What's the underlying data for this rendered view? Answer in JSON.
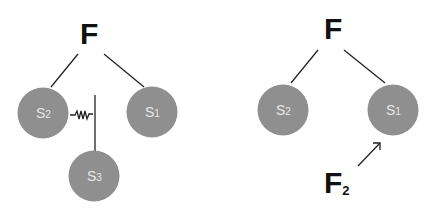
{
  "left_diagram": {
    "force_label": "F",
    "nodes": [
      {
        "id": "s2",
        "letter": "S",
        "sub": "2"
      },
      {
        "id": "s1",
        "letter": "S",
        "sub": "1"
      },
      {
        "id": "s3",
        "letter": "S",
        "sub": "3"
      }
    ],
    "connector": "spring"
  },
  "right_diagram": {
    "force_label": "F",
    "nodes": [
      {
        "id": "s2",
        "letter": "S",
        "sub": "2"
      },
      {
        "id": "s1",
        "letter": "S",
        "sub": "1"
      }
    ],
    "applied_force": {
      "letter": "F",
      "sub": "2"
    }
  },
  "colors": {
    "node": "#8f8f8f",
    "node_text": "#e8e8e8",
    "ink": "#111111"
  }
}
